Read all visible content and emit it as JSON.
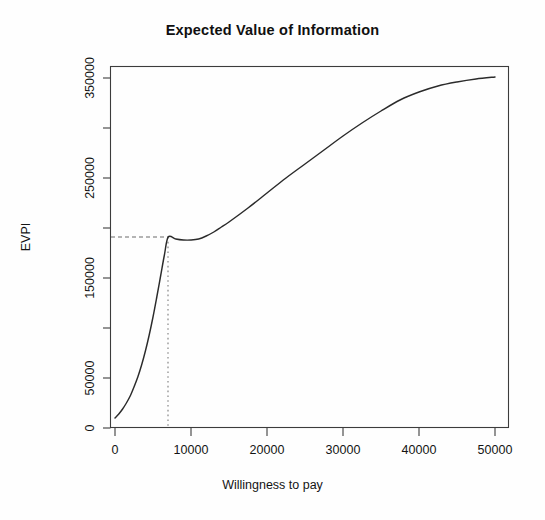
{
  "chart_data": {
    "type": "line",
    "title": "Expected Value of Information",
    "xlabel": "Willingness to pay",
    "ylabel": "EVPI",
    "xlim": [
      0,
      52000
    ],
    "ylim": [
      0,
      362000
    ],
    "grid": false,
    "legend": "none",
    "xticks": [
      0,
      10000,
      20000,
      30000,
      40000,
      50000
    ],
    "xtick_labels": [
      "0",
      "10000",
      "20000",
      "30000",
      "40000",
      "50000"
    ],
    "yticks": [
      0,
      50000,
      100000,
      150000,
      200000,
      250000,
      300000,
      350000
    ],
    "ytick_labels": [
      "0",
      "50000",
      "",
      "150000",
      "",
      "250000",
      "",
      "350000"
    ],
    "series": [
      {
        "name": "EVPI",
        "x": [
          0,
          500,
          1000,
          1500,
          2000,
          2500,
          3000,
          3500,
          4000,
          4500,
          5000,
          5500,
          6000,
          6500,
          7000,
          8000,
          9000,
          10000,
          11000,
          12000,
          13000,
          14000,
          15000,
          17500,
          20000,
          22500,
          25000,
          27500,
          30000,
          32500,
          35000,
          37500,
          40000,
          42500,
          45000,
          47500,
          50000
        ],
        "y": [
          10000,
          14000,
          19000,
          25000,
          32000,
          41000,
          51000,
          63000,
          77000,
          93000,
          111000,
          131000,
          152000,
          173000,
          191000,
          189000,
          188000,
          188000,
          189000,
          192000,
          196000,
          201000,
          206000,
          220000,
          235000,
          250000,
          264000,
          278000,
          292000,
          305000,
          317000,
          328000,
          336000,
          342000,
          346000,
          349000,
          351000
        ]
      }
    ],
    "annotations": {
      "reference_point_label": "optimal willingness to pay",
      "reference_x": 7000,
      "reference_y": 191000,
      "horizontal_reference_line": "dashed",
      "vertical_reference_line": "dotted"
    }
  }
}
